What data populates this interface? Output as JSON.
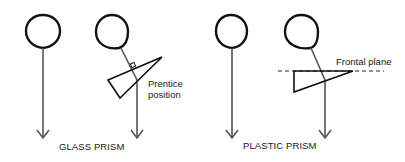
{
  "panels": [
    {
      "caption": "GLASS PRISM",
      "annotation_lines": [
        "Prentice",
        "position"
      ],
      "prism": "glass"
    },
    {
      "caption": "PLASTIC PRISM",
      "annotation_lines": [
        "Frontal plane"
      ],
      "prism": "plastic"
    }
  ],
  "colors": {
    "eye_outline": "#111111",
    "ray": "#555555",
    "prism_outline": "#111111",
    "text": "#1a1a1a"
  },
  "icons": {
    "eye": "circle-outline",
    "ray_arrow": "down-arrow",
    "prism": "triangle-outline",
    "right_angle_marker": "small-square",
    "frontal_plane": "dashed-line"
  }
}
